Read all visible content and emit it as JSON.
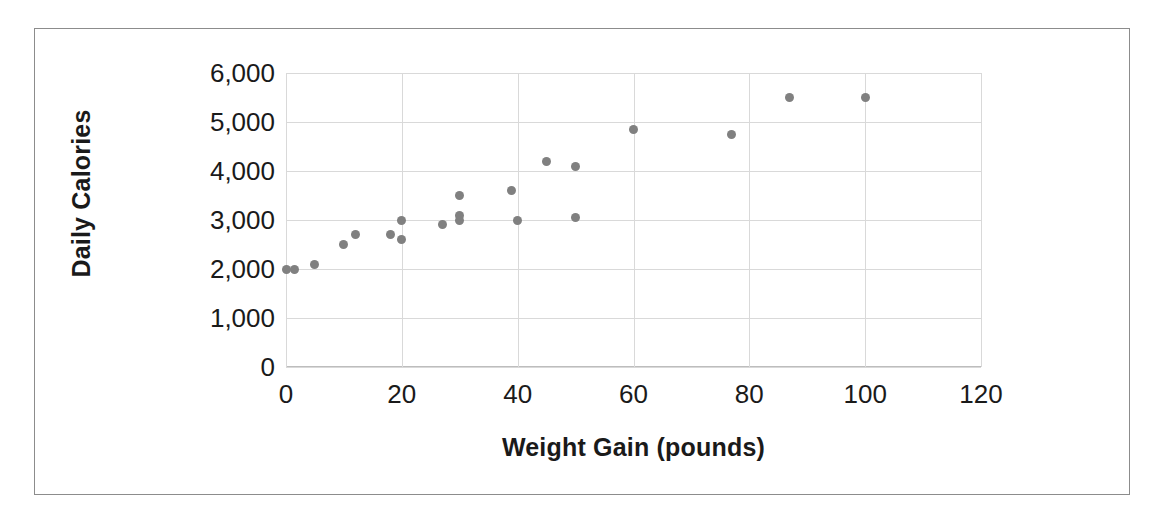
{
  "chart_data": {
    "type": "scatter",
    "title": "",
    "xlabel": "Weight Gain (pounds)",
    "ylabel": "Daily Calories",
    "xlim": [
      0,
      120
    ],
    "ylim": [
      0,
      6000
    ],
    "xticks": [
      0,
      20,
      40,
      60,
      80,
      100,
      120
    ],
    "xtick_labels": [
      "0",
      "20",
      "40",
      "60",
      "80",
      "100",
      "120"
    ],
    "yticks": [
      0,
      1000,
      2000,
      3000,
      4000,
      5000,
      6000
    ],
    "ytick_labels": [
      "0",
      "1,000",
      "2,000",
      "3,000",
      "4,000",
      "5,000",
      "6,000"
    ],
    "grid": true,
    "legend": false,
    "marker_color": "#808080",
    "gridline_color": "#d9d9d9",
    "points": [
      {
        "x": 0,
        "y": 2000
      },
      {
        "x": 1.5,
        "y": 2000
      },
      {
        "x": 5,
        "y": 2100
      },
      {
        "x": 10,
        "y": 2500
      },
      {
        "x": 12,
        "y": 2700
      },
      {
        "x": 18,
        "y": 2700
      },
      {
        "x": 20,
        "y": 3000
      },
      {
        "x": 20,
        "y": 2600
      },
      {
        "x": 27,
        "y": 2900
      },
      {
        "x": 30,
        "y": 3500
      },
      {
        "x": 30,
        "y": 3100
      },
      {
        "x": 30,
        "y": 3000
      },
      {
        "x": 39,
        "y": 3600
      },
      {
        "x": 40,
        "y": 3000
      },
      {
        "x": 45,
        "y": 4200
      },
      {
        "x": 50,
        "y": 4100
      },
      {
        "x": 50,
        "y": 3050
      },
      {
        "x": 60,
        "y": 4850
      },
      {
        "x": 77,
        "y": 4750
      },
      {
        "x": 87,
        "y": 5500
      },
      {
        "x": 100,
        "y": 5500
      }
    ]
  }
}
